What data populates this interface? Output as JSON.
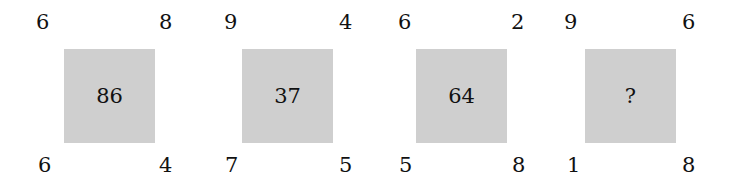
{
  "puzzle": {
    "blocks": [
      {
        "top_left": "6",
        "top_right": "8",
        "center": "86",
        "bottom_left": "6",
        "bottom_right": "4"
      },
      {
        "top_left": "9",
        "top_right": "4",
        "center": "37",
        "bottom_left": "7",
        "bottom_right": "5"
      },
      {
        "top_left": "6",
        "top_right": "2",
        "center": "64",
        "bottom_left": "5",
        "bottom_right": "8"
      },
      {
        "top_left": "9",
        "top_right": "6",
        "center": "?",
        "bottom_left": "1",
        "bottom_right": "8"
      }
    ],
    "colors": {
      "square_fill": "#cfcfcf",
      "background": "#ffffff",
      "text": "#111111"
    }
  }
}
